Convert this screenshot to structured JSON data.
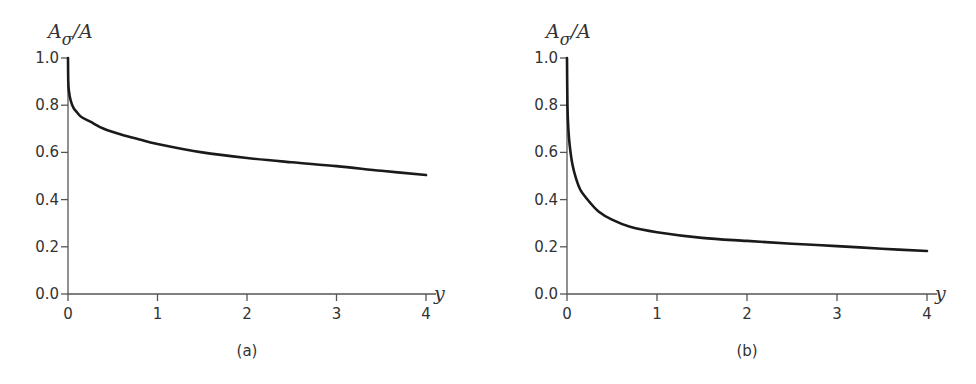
{
  "chart_data": [
    {
      "type": "line",
      "panel_label": "(a)",
      "title": "",
      "xlabel": "y",
      "ylabel": "A_σ/A",
      "ylabel_parts": {
        "main": "A",
        "sub": "σ",
        "rest": "/A"
      },
      "xlim": [
        0,
        4
      ],
      "ylim": [
        0,
        1.0
      ],
      "x_ticks": [
        "0",
        "1",
        "2",
        "3",
        "4"
      ],
      "y_ticks": [
        "0.0",
        "0.2",
        "0.4",
        "0.6",
        "0.8",
        "1.0"
      ],
      "grid": false,
      "legend": null,
      "series": [
        {
          "name": "A_σ/A",
          "x": [
            0,
            0.003,
            0.01,
            0.03,
            0.06,
            0.1,
            0.15,
            0.25,
            0.4,
            0.6,
            0.8,
            1.0,
            1.5,
            2.0,
            2.5,
            3.0,
            3.5,
            4.0
          ],
          "y": [
            1.0,
            0.9,
            0.86,
            0.82,
            0.79,
            0.77,
            0.75,
            0.73,
            0.7,
            0.675,
            0.655,
            0.636,
            0.6,
            0.576,
            0.558,
            0.542,
            0.522,
            0.504
          ]
        }
      ],
      "color": "#1a1a1a"
    },
    {
      "type": "line",
      "panel_label": "(b)",
      "title": "",
      "xlabel": "y",
      "ylabel": "A_σ/A",
      "ylabel_parts": {
        "main": "A",
        "sub": "σ",
        "rest": "/A"
      },
      "xlim": [
        0,
        4
      ],
      "ylim": [
        0,
        1.0
      ],
      "x_ticks": [
        "0",
        "1",
        "2",
        "3",
        "4"
      ],
      "y_ticks": [
        "0.0",
        "0.2",
        "0.4",
        "0.6",
        "0.8",
        "1.0"
      ],
      "grid": false,
      "legend": null,
      "series": [
        {
          "name": "A_σ/A",
          "x": [
            0,
            0.005,
            0.015,
            0.03,
            0.06,
            0.1,
            0.15,
            0.25,
            0.35,
            0.5,
            0.7,
            1.0,
            1.5,
            2.0,
            2.5,
            3.0,
            3.5,
            4.0
          ],
          "y": [
            1.0,
            0.8,
            0.7,
            0.63,
            0.55,
            0.49,
            0.44,
            0.39,
            0.35,
            0.315,
            0.285,
            0.262,
            0.238,
            0.225,
            0.213,
            0.203,
            0.192,
            0.182
          ]
        }
      ],
      "color": "#1a1a1a"
    }
  ]
}
